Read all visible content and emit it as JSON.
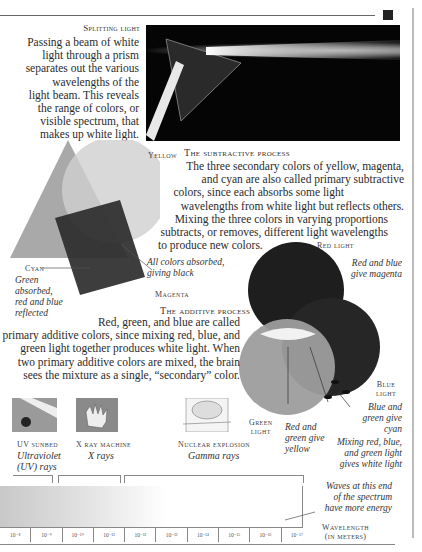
{
  "splitting": {
    "heading": "Splitting light",
    "body_lines": [
      "Passing a beam of white",
      "light through a prism",
      "separates out the various",
      "wavelengths of the",
      "light beam. This reveals",
      "the range of colors, or",
      "visible spectrum, that",
      "makes up white light."
    ]
  },
  "subtractive": {
    "heading": "The subtractive process",
    "body_lines": [
      "The three secondary colors of yellow, magenta,",
      "and cyan are also called primary subtractive",
      "colors, since each absorbs some light",
      "wavelengths from white light but reflects others.",
      "Mixing the three colors in varying proportions",
      "subtracts, or removes, different light wavelengths",
      "to produce new colors."
    ],
    "labels": {
      "yellow": "Yellow",
      "cyan": "Cyan",
      "magenta": "Magenta",
      "all_absorbed": [
        "All colors absorbed,",
        "giving black"
      ],
      "green_absorbed": [
        "Green",
        "absorbed,",
        "red and blue",
        "reflected"
      ]
    }
  },
  "additive": {
    "heading": "The additive process",
    "body_lines": [
      "Red, green, and blue are called",
      "primary additive colors, since mixing red, blue, and",
      "green light together produces white light. When",
      "two primary additive colors are mixed, the brain",
      "sees the mixture as a single, “secondary” color."
    ],
    "labels": {
      "red_light": "Red light",
      "red_blue": [
        "Red and blue",
        "give magenta"
      ],
      "blue_light": [
        "Blue",
        "light"
      ],
      "blue_green": [
        "Blue and",
        "green give",
        "cyan"
      ],
      "green_light": [
        "Green",
        "light"
      ],
      "red_green": [
        "Red and",
        "green give",
        "yellow"
      ],
      "mixing_all": [
        "Mixing red, blue,",
        "and green light",
        "gives white light"
      ]
    }
  },
  "examples": [
    {
      "icon": "uv-sunbed-icon",
      "title": "UV sunbed",
      "ray": [
        "Ultraviolet",
        "(UV) rays"
      ]
    },
    {
      "icon": "x-ray-machine-icon",
      "title": "X ray machine",
      "ray": [
        "X rays"
      ]
    },
    {
      "icon": "nuclear-explosion-icon",
      "title": "Nuclear explosion",
      "ray": [
        "Gamma rays"
      ]
    }
  ],
  "spectrum": {
    "note": [
      "Waves at this end",
      "of the spectrum",
      "have more energy"
    ],
    "axis_label": [
      "Wavelength",
      "(in meters)"
    ],
    "ticks": [
      "10⁻⁸",
      "10⁻⁹",
      "10⁻¹⁰",
      "10⁻¹¹",
      "10⁻¹²",
      "10⁻¹³",
      "10⁻¹⁴",
      "10⁻¹⁵",
      "10⁻¹⁶",
      "10⁻¹⁷"
    ]
  }
}
